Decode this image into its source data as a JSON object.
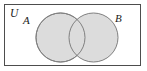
{
  "figure": {
    "type": "venn-diagram",
    "universe_label": "U",
    "set_a_label": "A",
    "set_b_label": "B",
    "colors": {
      "background": "#ffffff",
      "rectangle_stroke": "#4d4d4d",
      "circle_fill": "#dcdcdc",
      "circle_stroke": "#808080",
      "label_color": "#1a1a1a"
    },
    "geometry": {
      "rectangle": {
        "x": 4,
        "y": 4,
        "width": 137,
        "height": 62
      },
      "circle_a": {
        "cx": 60.5,
        "cy": 37.5,
        "r": 24.5
      },
      "circle_b": {
        "cx": 93.5,
        "cy": 37.5,
        "r": 24.5
      }
    },
    "label_positions": {
      "universe": {
        "x": 10,
        "y": 17
      },
      "set_a": {
        "x": 23,
        "y": 24
      },
      "set_b": {
        "x": 115,
        "y": 22
      }
    }
  }
}
